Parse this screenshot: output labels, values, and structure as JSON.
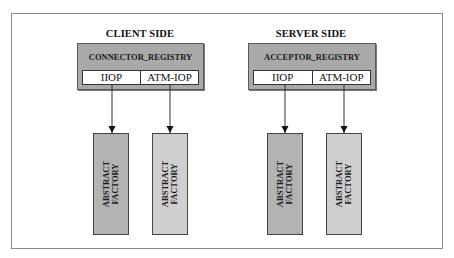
{
  "diagram": {
    "client": {
      "title": "CLIENT SIDE",
      "registry": "CONNECTOR_REGISTRY",
      "protocols": [
        "IIOP",
        "ATM-IOP"
      ],
      "factories": [
        {
          "line1": "ABSTRACT",
          "line2": "FACTORY",
          "shade": "#b3b3b3"
        },
        {
          "line1": "ABSTRACT",
          "line2": "FACTORY",
          "shade": "#cfcfcf"
        }
      ]
    },
    "server": {
      "title": "SERVER SIDE",
      "registry": "ACCEPTOR_REGISTRY",
      "protocols": [
        "IIOP",
        "ATM-IOP"
      ],
      "factories": [
        {
          "line1": "ABSTRACT",
          "line2": "FACTORY",
          "shade": "#b3b3b3"
        },
        {
          "line1": "ABSTRACT",
          "line2": "FACTORY",
          "shade": "#cfcfcf"
        }
      ]
    },
    "colors": {
      "registry_fill": "#a9a9a9",
      "frame_border": "#8a8a8a",
      "arrow": "#111111"
    }
  }
}
